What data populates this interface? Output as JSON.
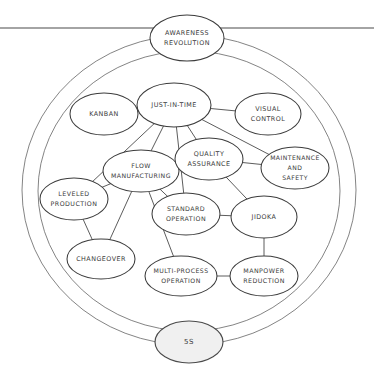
{
  "diagram": {
    "title_top": "AWARENESS REVOLUTION",
    "title_bottom": "5S",
    "style": {
      "ink": "#3c3c3c",
      "edge": "#4a4a4a",
      "ring": "#6e6e6e",
      "shaded_fill": "#f0f0f0",
      "page_bg": "#ffffff"
    },
    "nodes": [
      {
        "id": "awareness",
        "line1": "AWARENESS",
        "line2": "REVOLUTION",
        "line3": "",
        "cx": 187,
        "cy": 38,
        "rx": 37,
        "ry": 23,
        "shaded": false,
        "font": 6.4
      },
      {
        "id": "kanban",
        "line1": "KANBAN",
        "line2": "",
        "line3": "",
        "cx": 104,
        "cy": 114,
        "rx": 34,
        "ry": 21,
        "shaded": false,
        "font": 6.4
      },
      {
        "id": "jit",
        "line1": "JUST-IN-TIME",
        "line2": "",
        "line3": "",
        "cx": 174,
        "cy": 105,
        "rx": 37,
        "ry": 22,
        "shaded": false,
        "font": 6.4
      },
      {
        "id": "visual",
        "line1": "VISUAL",
        "line2": "CONTROL",
        "line3": "",
        "cx": 268,
        "cy": 114,
        "rx": 33,
        "ry": 21,
        "shaded": false,
        "font": 6.4
      },
      {
        "id": "flow",
        "line1": "FLOW",
        "line2": "MANUFACTURING",
        "line3": "",
        "cx": 141,
        "cy": 171,
        "rx": 38,
        "ry": 21,
        "shaded": false,
        "font": 6.2
      },
      {
        "id": "quality",
        "line1": "QUALITY",
        "line2": "ASSURANCE",
        "line3": "",
        "cx": 209,
        "cy": 159,
        "rx": 34,
        "ry": 21,
        "shaded": false,
        "font": 6.4
      },
      {
        "id": "maintenance",
        "line1": "MAINTENANCE",
        "line2": "AND",
        "line3": "SAFETY",
        "cx": 295,
        "cy": 168,
        "rx": 34,
        "ry": 21,
        "shaded": false,
        "font": 6.1
      },
      {
        "id": "leveled",
        "line1": "LEVELED",
        "line2": "PRODUCTION",
        "line3": "",
        "cx": 74,
        "cy": 199,
        "rx": 34,
        "ry": 21,
        "shaded": false,
        "font": 6.3
      },
      {
        "id": "standard",
        "line1": "STANDARD",
        "line2": "OPERATION",
        "line3": "",
        "cx": 186,
        "cy": 214,
        "rx": 34,
        "ry": 21,
        "shaded": false,
        "font": 6.3
      },
      {
        "id": "jidoka",
        "line1": "JIDOKA",
        "line2": "",
        "line3": "",
        "cx": 264,
        "cy": 217,
        "rx": 33,
        "ry": 21,
        "shaded": false,
        "font": 6.4
      },
      {
        "id": "changeover",
        "line1": "CHANGEOVER",
        "line2": "",
        "line3": "",
        "cx": 101,
        "cy": 259,
        "rx": 34,
        "ry": 20,
        "shaded": false,
        "font": 6.4
      },
      {
        "id": "multiproc",
        "line1": "MULTI-PROCESS",
        "line2": "OPERATION",
        "line3": "",
        "cx": 181,
        "cy": 276,
        "rx": 36,
        "ry": 20,
        "shaded": false,
        "font": 6.2
      },
      {
        "id": "manpower",
        "line1": "MANPOWER",
        "line2": "REDUCTION",
        "line3": "",
        "cx": 264,
        "cy": 276,
        "rx": 34,
        "ry": 20,
        "shaded": false,
        "font": 6.3
      },
      {
        "id": "fives",
        "line1": "5S",
        "line2": "",
        "line3": "",
        "cx": 189,
        "cy": 342,
        "rx": 34,
        "ry": 21,
        "shaded": true,
        "font": 7.0
      }
    ],
    "edges": [
      {
        "from": "jit",
        "to": "kanban"
      },
      {
        "from": "jit",
        "to": "visual"
      },
      {
        "from": "jit",
        "to": "flow"
      },
      {
        "from": "jit",
        "to": "quality"
      },
      {
        "from": "jit",
        "to": "standard"
      },
      {
        "from": "jit",
        "to": "maintenance"
      },
      {
        "from": "jit",
        "to": "leveled"
      },
      {
        "from": "quality",
        "to": "jidoka"
      },
      {
        "from": "quality",
        "to": "maintenance"
      },
      {
        "from": "flow",
        "to": "leveled"
      },
      {
        "from": "flow",
        "to": "changeover"
      },
      {
        "from": "flow",
        "to": "multiproc"
      },
      {
        "from": "flow",
        "to": "standard"
      },
      {
        "from": "leveled",
        "to": "changeover"
      },
      {
        "from": "standard",
        "to": "jidoka"
      },
      {
        "from": "jidoka",
        "to": "manpower"
      },
      {
        "from": "multiproc",
        "to": "manpower"
      }
    ],
    "rings": [
      {
        "id": "outer-ring",
        "cx": 189,
        "cy": 190,
        "rx": 167,
        "ry": 155
      },
      {
        "id": "inner-ring",
        "cx": 189,
        "cy": 191,
        "rx": 151,
        "ry": 140
      }
    ],
    "top_rule": {
      "y": 28,
      "x1": 0,
      "x2": 374
    }
  }
}
